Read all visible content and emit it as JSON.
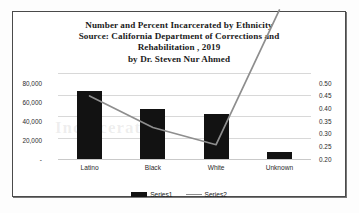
{
  "chart_data": {
    "type": "bar",
    "title": "Number and Percent Incarcerated by Ethnicity Source: California Department of Corrections and Rehabilitation , 2019 by Dr. Steven Nur Ahmed",
    "title_lines": [
      "Number and Percent Incarcerated by Ethnicity",
      "Source: California Department of Corrections and",
      "Rehabilitation , 2019",
      "by Dr. Steven Nur Ahmed"
    ],
    "categories": [
      "Latino",
      "Black",
      "White",
      "Unknown"
    ],
    "series": [
      {
        "name": "Series1",
        "type": "bar",
        "axis": "left",
        "values": [
          63000,
          47000,
          42000,
          7000
        ]
      },
      {
        "name": "Series2",
        "type": "line",
        "axis": "right",
        "values": [
          0.42,
          0.31,
          0.25,
          0.72
        ]
      }
    ],
    "xlabel": "",
    "ylabel": "",
    "ylim": [
      0,
      80000
    ],
    "y2lim": [
      0.2,
      0.5
    ],
    "yticks": [
      "-",
      "20,000",
      "40,000",
      "60,000",
      "80,000"
    ],
    "ytick_values": [
      0,
      20000,
      40000,
      60000,
      80000
    ],
    "y2ticks": [
      "0.20",
      "0.25",
      "0.30",
      "0.35",
      "0.40",
      "0.45",
      "0.50"
    ],
    "y2tick_values": [
      0.2,
      0.25,
      0.3,
      0.35,
      0.4,
      0.45,
      0.5
    ],
    "grid": true,
    "legend_position": "bottom",
    "legend": [
      "Series1",
      "Series2"
    ],
    "note": "Series2 line rises above the top of the plot area at Unknown and is clipped",
    "colors": {
      "bar": "#121212",
      "line": "#8e8e8e",
      "grid": "#d8d8d8",
      "frame": "#4a4a4a",
      "text": "#1b1b1b",
      "background": "#ffffff"
    }
  },
  "ghost_text": "Incarcerated"
}
